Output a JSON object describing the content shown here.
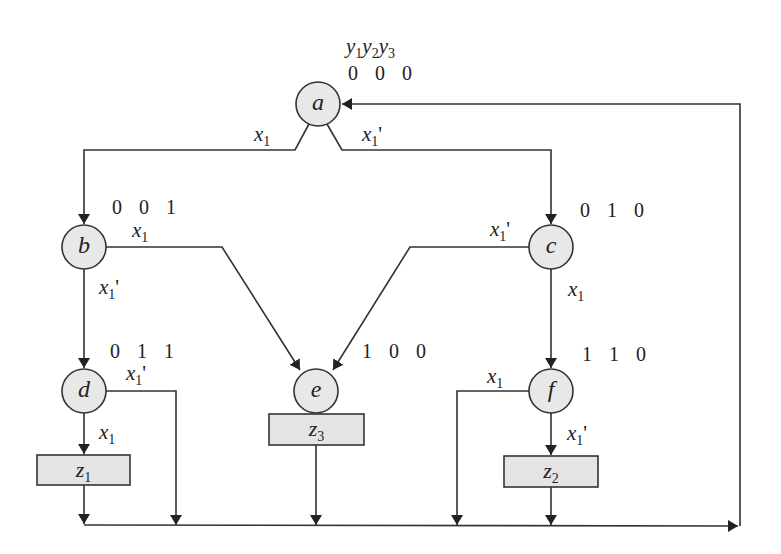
{
  "diagram": {
    "header": {
      "var_prefix": "y",
      "vars": [
        "1",
        "2",
        "3"
      ]
    },
    "states": [
      {
        "id": "a",
        "code": "0 0 0"
      },
      {
        "id": "b",
        "code": "0 0 1"
      },
      {
        "id": "c",
        "code": "0 1 0"
      },
      {
        "id": "d",
        "code": "0 1 1"
      },
      {
        "id": "e",
        "code": "1 0 0"
      },
      {
        "id": "f",
        "code": "1 1 0"
      }
    ],
    "outputs": [
      {
        "id": "z1",
        "var": "z",
        "sub": "1"
      },
      {
        "id": "z2",
        "var": "z",
        "sub": "2"
      },
      {
        "id": "z3",
        "var": "z",
        "sub": "3"
      }
    ],
    "conditions": {
      "var": "x",
      "sub": "1",
      "prime": "'"
    },
    "transitions": [
      {
        "from": "a",
        "to": "b",
        "cond": "x1"
      },
      {
        "from": "a",
        "to": "c",
        "cond": "x1'"
      },
      {
        "from": "b",
        "to": "e",
        "cond": "x1"
      },
      {
        "from": "b",
        "to": "d",
        "cond": "x1'"
      },
      {
        "from": "c",
        "to": "e",
        "cond": "x1'"
      },
      {
        "from": "c",
        "to": "f",
        "cond": "x1"
      },
      {
        "from": "d",
        "to": "z1",
        "cond": "x1"
      },
      {
        "from": "d",
        "to": "a",
        "cond": "x1'"
      },
      {
        "from": "e",
        "to": "z3",
        "cond": ""
      },
      {
        "from": "f",
        "to": "a",
        "cond": "x1"
      },
      {
        "from": "f",
        "to": "z2",
        "cond": "x1'"
      },
      {
        "from": "z1",
        "to": "a",
        "cond": ""
      },
      {
        "from": "z2",
        "to": "a",
        "cond": ""
      },
      {
        "from": "z3",
        "to": "a",
        "cond": ""
      }
    ],
    "colors": {
      "node_fill": "#e8e8e8",
      "stroke": "#333333",
      "box_fill": "#e4e4e4"
    }
  }
}
